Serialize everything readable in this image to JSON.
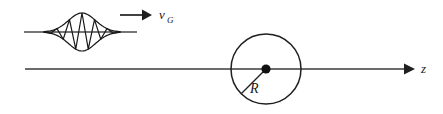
{
  "figure": {
    "background_color": "#ffffff",
    "stroke_color": "#262626",
    "axis_color": "#3a3a3a",
    "width": 443,
    "height": 114
  },
  "labels": {
    "group_velocity": "v",
    "group_velocity_subscript": "G",
    "radius": "R",
    "axis": "z"
  },
  "chart_data": {
    "type": "line",
    "xlabel": "z",
    "ylabel": "",
    "grid": false,
    "legend": "none",
    "annotations": [
      {
        "name": "group-velocity-label",
        "text": "v_G",
        "x": 160,
        "y": 16
      },
      {
        "name": "radius-label",
        "text": "R",
        "x": 253,
        "y": 90
      },
      {
        "name": "axis-label",
        "text": "z",
        "x": 424,
        "y": 72
      }
    ],
    "elements": {
      "main_axis": {
        "name": "z-axis",
        "x_start": 25,
        "x_end": 412,
        "y": 69,
        "arrow_at_end": true
      },
      "packet_axis": {
        "name": "wave-packet-baseline",
        "x_start": 24,
        "x_end": 137,
        "y": 32
      },
      "direction_arrow": {
        "name": "propagation-arrow",
        "x_start": 120,
        "x_end": 150,
        "y": 15
      },
      "sphere": {
        "name": "scattering-sphere",
        "center_x": 266,
        "center_y": 69,
        "radius": 35
      },
      "center_dot": {
        "name": "sphere-center-dot",
        "x": 266,
        "y": 69,
        "radius": 4.5
      },
      "radius_line": {
        "name": "radius-segment",
        "x_start": 266,
        "y_start": 69,
        "x_end": 241,
        "y_end": 94
      }
    },
    "wave_packet": {
      "description": "Gaussian envelope enclosing a carrier oscillation",
      "center_x": 82,
      "baseline_y": 32,
      "envelope_sigma": 13.5,
      "envelope_amplitude": 19,
      "envelope_half_width": 38,
      "carrier_wavelength": 12.5,
      "carrier_cycles": 5,
      "envelope_x": [
        44,
        48,
        52,
        56,
        60,
        64,
        68,
        72,
        76,
        80,
        84,
        88,
        92,
        96,
        100,
        104,
        108,
        112,
        116,
        120
      ],
      "envelope_y": [
        0.5,
        1.1,
        2.2,
        4.0,
        6.6,
        9.9,
        13.4,
        16.6,
        18.6,
        19.0,
        18.6,
        16.6,
        13.4,
        9.9,
        6.6,
        4.0,
        2.2,
        1.1,
        0.5,
        0.1
      ]
    }
  }
}
